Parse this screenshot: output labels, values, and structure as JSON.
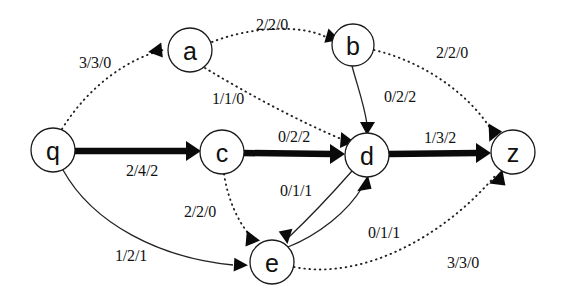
{
  "diagram": {
    "background_color": "#ffffff",
    "ink_color": "#111111",
    "label_format": "flow/capacity/residual",
    "nodes": [
      {
        "id": "q",
        "label": "q",
        "cx": 53,
        "cy": 150,
        "r": 22
      },
      {
        "id": "a",
        "label": "a",
        "cx": 190,
        "cy": 50,
        "r": 22
      },
      {
        "id": "b",
        "label": "b",
        "cx": 353,
        "cy": 45,
        "r": 21
      },
      {
        "id": "c",
        "label": "c",
        "cx": 222,
        "cy": 152,
        "r": 22
      },
      {
        "id": "d",
        "label": "d",
        "cx": 367,
        "cy": 155,
        "r": 22
      },
      {
        "id": "e",
        "label": "e",
        "cx": 272,
        "cy": 262,
        "r": 22
      },
      {
        "id": "z",
        "label": "z",
        "cx": 513,
        "cy": 152,
        "r": 22
      }
    ],
    "edges": [
      {
        "id": "q-a",
        "from": "q",
        "to": "a",
        "label": "3/3/0",
        "style": "dotted",
        "label_x": 95,
        "label_y": 62
      },
      {
        "id": "a-b",
        "from": "a",
        "to": "b",
        "label": "2/2/0",
        "style": "dotted",
        "label_x": 272,
        "label_y": 24
      },
      {
        "id": "b-z",
        "from": "b",
        "to": "z",
        "label": "2/2/0",
        "style": "dotted",
        "label_x": 452,
        "label_y": 52
      },
      {
        "id": "a-d",
        "from": "a",
        "to": "d",
        "label": "1/1/0",
        "style": "dotted",
        "label_x": 228,
        "label_y": 98
      },
      {
        "id": "b-d",
        "from": "b",
        "to": "d",
        "label": "0/2/2",
        "style": "thin",
        "label_x": 400,
        "label_y": 96
      },
      {
        "id": "q-c",
        "from": "q",
        "to": "c",
        "label": "2/4/2",
        "style": "thick",
        "label_x": 142,
        "label_y": 170
      },
      {
        "id": "c-d",
        "from": "c",
        "to": "d",
        "label": "0/2/2",
        "style": "thick",
        "label_x": 294,
        "label_y": 136
      },
      {
        "id": "d-z",
        "from": "d",
        "to": "z",
        "label": "1/3/2",
        "style": "thick",
        "label_x": 440,
        "label_y": 137
      },
      {
        "id": "c-e",
        "from": "c",
        "to": "e",
        "label": "2/2/0",
        "style": "dotted",
        "label_x": 200,
        "label_y": 211
      },
      {
        "id": "q-e",
        "from": "q",
        "to": "e",
        "label": "1/2/1",
        "style": "thin",
        "label_x": 131,
        "label_y": 255
      },
      {
        "id": "d-e",
        "from": "d",
        "to": "e",
        "label": "0/1/1",
        "style": "thin",
        "label_x": 296,
        "label_y": 190
      },
      {
        "id": "e-d",
        "from": "e",
        "to": "d",
        "label": "0/1/1",
        "style": "thin",
        "label_x": 384,
        "label_y": 232
      },
      {
        "id": "e-z",
        "from": "e",
        "to": "z",
        "label": "3/3/0",
        "style": "dotted",
        "label_x": 463,
        "label_y": 262
      }
    ]
  }
}
